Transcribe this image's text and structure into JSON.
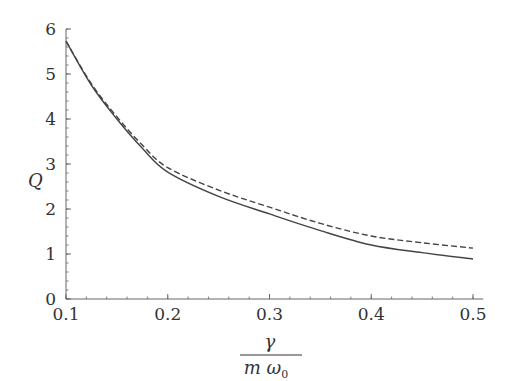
{
  "chart_data": {
    "type": "line",
    "title": "",
    "xlabel": "γ / (m ω0)",
    "xlabel_parts": {
      "numerator": "γ",
      "denominator_main": "m ω",
      "denominator_sub": "0"
    },
    "ylabel": "Q",
    "xlim": [
      0.1,
      0.51
    ],
    "ylim": [
      0,
      6
    ],
    "grid": false,
    "legend": null,
    "x_ticks": [
      0.1,
      0.2,
      0.3,
      0.4,
      0.5
    ],
    "x_tick_labels": [
      "0.1",
      "0.2",
      "0.3",
      "0.4",
      "0.5"
    ],
    "y_ticks": [
      0,
      1,
      2,
      3,
      4,
      5,
      6
    ],
    "y_tick_labels": [
      "0",
      "1",
      "2",
      "3",
      "4",
      "5",
      "6"
    ],
    "x_minor_step": 0.02,
    "y_minor_step": 0.2,
    "series": [
      {
        "name": "solid",
        "style": "solid",
        "color": "#444444",
        "x": [
          0.1,
          0.125,
          0.15,
          0.175,
          0.2,
          0.25,
          0.3,
          0.35,
          0.4,
          0.45,
          0.5
        ],
        "y": [
          5.73,
          4.75,
          4.0,
          3.35,
          2.82,
          2.28,
          1.89,
          1.52,
          1.2,
          1.03,
          0.89
        ]
      },
      {
        "name": "dashed",
        "style": "dashed",
        "color": "#444444",
        "x": [
          0.1,
          0.125,
          0.15,
          0.175,
          0.2,
          0.25,
          0.3,
          0.35,
          0.4,
          0.45,
          0.5
        ],
        "y": [
          5.73,
          4.78,
          4.05,
          3.42,
          2.92,
          2.42,
          2.04,
          1.68,
          1.4,
          1.25,
          1.13
        ]
      }
    ]
  }
}
